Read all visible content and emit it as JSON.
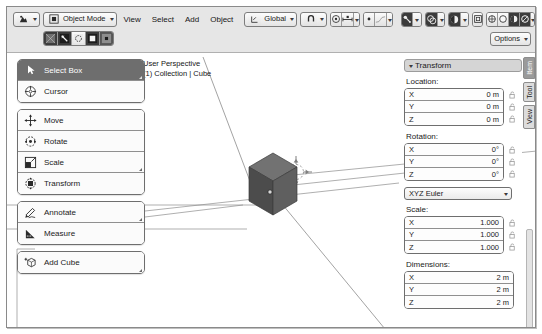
{
  "app": {
    "title": "Blender 3D Viewport"
  },
  "header": {
    "editor_type": {
      "name": "editor-type-selector",
      "icon": "viewport-icon"
    },
    "mode": {
      "label": "Object Mode",
      "icon": "object-mode-icon"
    },
    "menus": [
      "View",
      "Select",
      "Add",
      "Object"
    ],
    "transform_orientation": {
      "label": "Global",
      "icon": "axis-icon"
    },
    "snap": {
      "icon": "magnet-icon"
    },
    "proportional": {
      "icon": "proportional-edit-icon"
    },
    "proportional_falloff": {
      "icon": "falloff-curve-icon"
    },
    "select_modes": [
      "tweak",
      "box",
      "circle",
      "lasso",
      "cursor"
    ],
    "shading_modes": [
      "wireframe",
      "solid",
      "material",
      "rendered"
    ],
    "overlays": {
      "icon": "overlays-icon"
    },
    "xray": {
      "icon": "xray-icon"
    },
    "viewport_gizmo": {
      "icon": "gizmo-icon"
    },
    "show_overlays_toggle": {
      "icon": "show-overlays-icon"
    },
    "options_label": "Options"
  },
  "toolbar": {
    "groups": [
      {
        "items": [
          {
            "label": "Select Box",
            "icon": "select-box-icon",
            "active": true,
            "has_submenu": true
          },
          {
            "label": "Cursor",
            "icon": "cursor-3d-icon",
            "active": false,
            "has_submenu": false
          }
        ]
      },
      {
        "items": [
          {
            "label": "Move",
            "icon": "move-icon",
            "active": false,
            "has_submenu": false
          },
          {
            "label": "Rotate",
            "icon": "rotate-icon",
            "active": false,
            "has_submenu": false
          },
          {
            "label": "Scale",
            "icon": "scale-icon",
            "active": false,
            "has_submenu": true
          },
          {
            "label": "Transform",
            "icon": "transform-icon",
            "active": false,
            "has_submenu": false
          }
        ]
      },
      {
        "items": [
          {
            "label": "Annotate",
            "icon": "annotate-icon",
            "active": false,
            "has_submenu": true
          },
          {
            "label": "Measure",
            "icon": "measure-icon",
            "active": false,
            "has_submenu": false
          }
        ]
      },
      {
        "items": [
          {
            "label": "Add Cube",
            "icon": "add-cube-icon",
            "active": false,
            "has_submenu": true
          }
        ]
      }
    ]
  },
  "viewport": {
    "info_line1": "User Perspective",
    "info_line2": "(1) Collection | Cube",
    "object": "Cube",
    "cursor_3d": "3d-cursor"
  },
  "sidebar": {
    "panel_title": "Transform",
    "tabs": [
      {
        "label": "Item",
        "active": true
      },
      {
        "label": "Tool",
        "active": false
      },
      {
        "label": "View",
        "active": false
      }
    ],
    "sections": [
      {
        "label": "Location:",
        "rows": [
          {
            "axis": "X",
            "value": "0 m"
          },
          {
            "axis": "Y",
            "value": "0 m"
          },
          {
            "axis": "Z",
            "value": "0 m"
          }
        ],
        "locks": true
      },
      {
        "label": "Rotation:",
        "rows": [
          {
            "axis": "X",
            "value": "0°"
          },
          {
            "axis": "Y",
            "value": "0°"
          },
          {
            "axis": "Z",
            "value": "0°"
          }
        ],
        "locks": true
      }
    ],
    "rotation_mode": "XYZ Euler",
    "scale": {
      "label": "Scale:",
      "rows": [
        {
          "axis": "X",
          "value": "1.000"
        },
        {
          "axis": "Y",
          "value": "1.000"
        },
        {
          "axis": "Z",
          "value": "1.000"
        }
      ],
      "locks": true
    },
    "dimensions": {
      "label": "Dimensions:",
      "rows": [
        {
          "axis": "X",
          "value": "2 m"
        },
        {
          "axis": "Y",
          "value": "2 m"
        },
        {
          "axis": "Z",
          "value": "2 m"
        }
      ],
      "locks": false
    }
  },
  "colors": {
    "header_bg": "#e6e6e6",
    "active_tool": "#6e6e6e",
    "panel_head": "#d5d5d5",
    "cube_top": "#7b7b7b",
    "cube_left": "#4e4e4e",
    "cube_right": "#636363",
    "grid_line": "#8c8c8c"
  }
}
